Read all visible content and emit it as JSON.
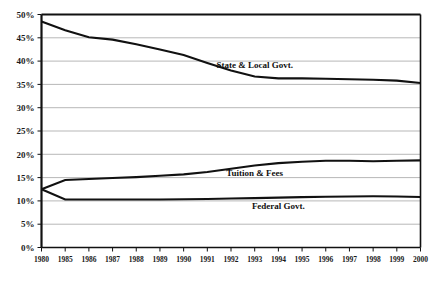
{
  "chart_data": {
    "type": "line",
    "title": "",
    "subtitle": "",
    "xlabel": "",
    "ylabel": "",
    "grid": true,
    "legend_position": "inline-right",
    "ylim": [
      0,
      50
    ],
    "ytick_labels": [
      "0%",
      "5%",
      "10%",
      "15%",
      "20%",
      "25%",
      "30%",
      "35%",
      "40%",
      "45%",
      "50%"
    ],
    "ytick_values": [
      0,
      5,
      10,
      15,
      20,
      25,
      30,
      35,
      40,
      45,
      50
    ],
    "categories": [
      "1980",
      "1985",
      "1986",
      "1987",
      "1988",
      "1989",
      "1990",
      "1991",
      "1992",
      "1993",
      "1994",
      "1995",
      "1996",
      "1997",
      "1998",
      "1999",
      "2000"
    ],
    "series": [
      {
        "name": "State & Local Govt.",
        "label": "State & Local Govt.",
        "values": [
          48.5,
          46.6,
          45.1,
          44.6,
          43.6,
          42.5,
          41.3,
          39.6,
          38.0,
          36.7,
          36.3,
          36.3,
          36.2,
          36.1,
          36.0,
          35.8,
          35.3
        ]
      },
      {
        "name": "Tuition & Fees",
        "label": "Tuition & Fees",
        "values": [
          12.5,
          14.5,
          14.7,
          14.9,
          15.1,
          15.4,
          15.7,
          16.2,
          16.9,
          17.6,
          18.1,
          18.4,
          18.6,
          18.6,
          18.5,
          18.6,
          18.7
        ]
      },
      {
        "name": "Federal Govt.",
        "label": "Federal Govt.",
        "values": [
          12.5,
          10.3,
          10.3,
          10.3,
          10.3,
          10.3,
          10.35,
          10.4,
          10.5,
          10.6,
          10.7,
          10.8,
          10.9,
          10.95,
          11.0,
          10.95,
          10.85
        ]
      }
    ],
    "annotations": [
      {
        "name": "state-local-label",
        "text": "State & Local Govt.",
        "x_category": "1993",
        "y_value": 38.6
      },
      {
        "name": "tuition-fees-label",
        "text": "Tuition & Fees",
        "x_category": "1993",
        "y_value": 15.4
      },
      {
        "name": "federal-govt-label",
        "text": "Federal Govt.",
        "x_category": "1994",
        "y_value": 8.2
      }
    ],
    "colors": {
      "line": "#111111",
      "grid": "#9a9a9a",
      "axis": "#111111",
      "background": "#ffffff",
      "text": "#1a1a1a"
    }
  }
}
